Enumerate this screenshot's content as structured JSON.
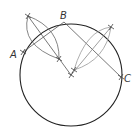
{
  "diagram": {
    "type": "geometric-construction",
    "colors": {
      "circle": "#222222",
      "chord": "#555555",
      "arc": "#777777",
      "arc_light": "#aaaaaa",
      "label": "#333333"
    },
    "points": {
      "A": {
        "label": "A",
        "x": 23,
        "y": 52
      },
      "B": {
        "label": "B",
        "x": 64,
        "y": 22
      },
      "C": {
        "label": "C",
        "x": 121,
        "y": 77
      },
      "center": {
        "x": 71,
        "y": 75
      }
    },
    "circle": {
      "cx": 71,
      "cy": 75,
      "r": 51
    },
    "labels": {
      "A": "A",
      "B": "B",
      "C": "C"
    }
  }
}
